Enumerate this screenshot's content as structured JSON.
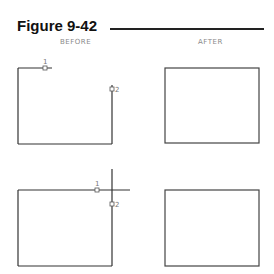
{
  "figure": {
    "title": "Figure 9-42",
    "columns": {
      "before": "BEFORE",
      "after": "AFTER"
    },
    "panels": [
      {
        "name": "before-top",
        "description": "Unclosed shape: top edge stops short, right edge begins below top; pick points 1 and 2",
        "points": [
          {
            "label": "1"
          },
          {
            "label": "2"
          }
        ]
      },
      {
        "name": "after-top",
        "description": "Closed rectangle after filleting/trimming"
      },
      {
        "name": "before-bottom",
        "description": "Rectangle with overshooting top and right edges crossing; pick points 1 and 2",
        "points": [
          {
            "label": "1"
          },
          {
            "label": "2"
          }
        ]
      },
      {
        "name": "after-bottom",
        "description": "Closed rectangle after trimming overshoots"
      }
    ]
  },
  "colors": {
    "line": "#333333",
    "label": "#8a8a8a",
    "title": "#111111"
  }
}
